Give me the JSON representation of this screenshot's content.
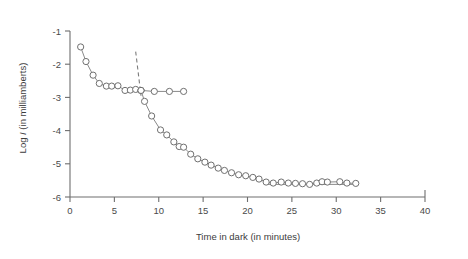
{
  "chart_data": {
    "type": "scatter",
    "title": "",
    "xlabel": "Time in dark (in minutes)",
    "ylabel_prefix": "Log ",
    "ylabel_symbol": "I",
    "ylabel_suffix": " (in milliamberts)",
    "ylabel": "Log I (in milliamberts)",
    "xlim": [
      0,
      40
    ],
    "ylim": [
      -6,
      -1
    ],
    "xticks": [
      0,
      5,
      10,
      15,
      20,
      25,
      30,
      35,
      40
    ],
    "yticks": [
      -1,
      -2,
      -3,
      -4,
      -5,
      -6
    ],
    "xtick_labels": [
      "0",
      "5",
      "10",
      "15",
      "20",
      "25",
      "30",
      "35",
      "40"
    ],
    "ytick_labels": [
      "-1",
      "-2",
      "-3",
      "-4",
      "-5",
      "-6"
    ],
    "grid": false,
    "legend": "none",
    "marker_style": "open-circle",
    "annotations": [
      {
        "name": "rod-cone-break-dashed-line",
        "style": "dashed",
        "x_start": 7.4,
        "y_start": -1.62,
        "x_end": 8.0,
        "y_end": -2.95
      }
    ],
    "series": [
      {
        "name": "Cone branch",
        "connected": true,
        "points": [
          {
            "x": 1.2,
            "y": -1.48
          },
          {
            "x": 1.8,
            "y": -1.92
          },
          {
            "x": 2.6,
            "y": -2.33
          },
          {
            "x": 3.3,
            "y": -2.58
          },
          {
            "x": 4.1,
            "y": -2.66
          },
          {
            "x": 4.7,
            "y": -2.66
          },
          {
            "x": 5.4,
            "y": -2.65
          },
          {
            "x": 6.2,
            "y": -2.79
          },
          {
            "x": 6.8,
            "y": -2.78
          },
          {
            "x": 7.4,
            "y": -2.76
          },
          {
            "x": 8.0,
            "y": -2.79
          }
        ]
      },
      {
        "name": "Cone plateau",
        "connected": true,
        "points": [
          {
            "x": 8.0,
            "y": -2.79
          },
          {
            "x": 9.5,
            "y": -2.82
          },
          {
            "x": 11.2,
            "y": -2.82
          },
          {
            "x": 12.8,
            "y": -2.82
          }
        ]
      },
      {
        "name": "Rod branch",
        "connected": true,
        "points": [
          {
            "x": 8.0,
            "y": -2.79
          },
          {
            "x": 8.4,
            "y": -3.12
          },
          {
            "x": 9.2,
            "y": -3.56
          },
          {
            "x": 10.2,
            "y": -3.98
          },
          {
            "x": 10.9,
            "y": -4.13
          },
          {
            "x": 11.7,
            "y": -4.34
          },
          {
            "x": 12.3,
            "y": -4.48
          },
          {
            "x": 12.8,
            "y": -4.5
          },
          {
            "x": 13.6,
            "y": -4.71
          },
          {
            "x": 14.4,
            "y": -4.85
          },
          {
            "x": 15.2,
            "y": -4.95
          },
          {
            "x": 15.9,
            "y": -5.04
          },
          {
            "x": 16.7,
            "y": -5.13
          },
          {
            "x": 17.4,
            "y": -5.2
          },
          {
            "x": 18.2,
            "y": -5.27
          },
          {
            "x": 19.0,
            "y": -5.33
          },
          {
            "x": 19.8,
            "y": -5.36
          },
          {
            "x": 20.6,
            "y": -5.41
          },
          {
            "x": 21.3,
            "y": -5.46
          },
          {
            "x": 22.1,
            "y": -5.55
          },
          {
            "x": 22.9,
            "y": -5.58
          },
          {
            "x": 23.8,
            "y": -5.55
          },
          {
            "x": 24.6,
            "y": -5.58
          },
          {
            "x": 25.4,
            "y": -5.59
          },
          {
            "x": 26.2,
            "y": -5.6
          },
          {
            "x": 27.0,
            "y": -5.62
          },
          {
            "x": 27.8,
            "y": -5.58
          },
          {
            "x": 28.4,
            "y": -5.54
          },
          {
            "x": 29.0,
            "y": -5.55
          },
          {
            "x": 30.4,
            "y": -5.54
          },
          {
            "x": 31.2,
            "y": -5.58
          },
          {
            "x": 32.2,
            "y": -5.59
          }
        ]
      },
      {
        "name": "Rod plateau",
        "connected": true,
        "points": [
          {
            "x": 22.1,
            "y": -5.62
          },
          {
            "x": 32.2,
            "y": -5.62
          }
        ]
      }
    ]
  }
}
